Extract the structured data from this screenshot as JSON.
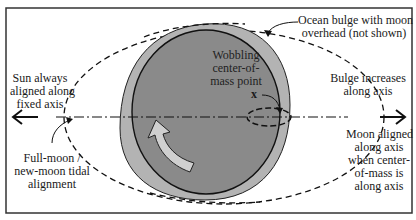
{
  "diagram": {
    "labels": {
      "sun": [
        "Sun always",
        "aligned along",
        "fixed axis"
      ],
      "ocean_bulge": [
        "Ocean bulge with moon",
        "overhead (not shown)"
      ],
      "wobbling": [
        "Wobbling",
        "center-of-",
        "mass point"
      ],
      "center_mark": "x",
      "bulge_increases": [
        "Bulge increases",
        "along axis"
      ],
      "full_moon": [
        "Full-moon /",
        "new-moon tidal",
        "alignment"
      ],
      "moon_aligned": [
        "Moon aligned",
        "along axis",
        "when center-",
        "of-mass is",
        "along axis"
      ]
    },
    "colors": {
      "background": "#ffffff",
      "frame": "#333333",
      "ocean_bulge_fill": "#b3b3b3",
      "earth_fill": "#8a8a8a",
      "line": "#111111",
      "arrow_fill": "#cfcfcf"
    }
  }
}
